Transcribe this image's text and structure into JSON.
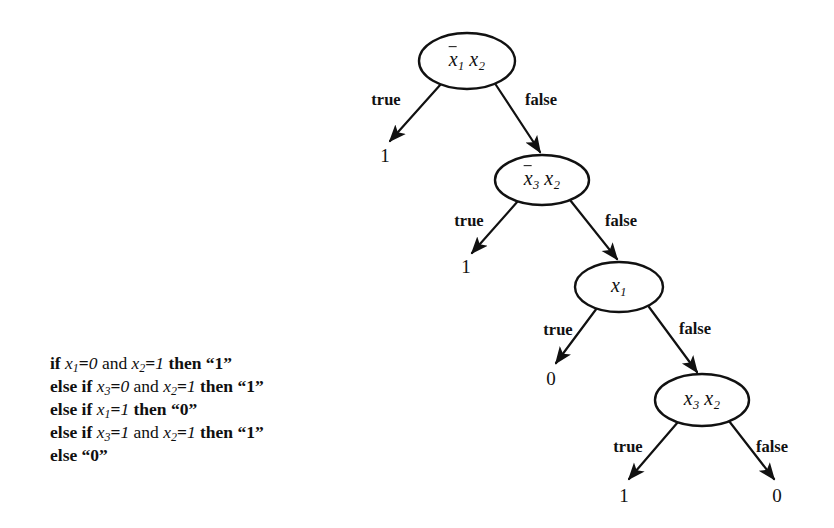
{
  "figure": {
    "type": "decision-tree-diagram",
    "background_color": "#ffffff",
    "ink_color": "#111111"
  },
  "pseudocode": {
    "lines": [
      {
        "id": "line-1",
        "text": "if x1=0 and x2=1 then “1”",
        "parts": [
          {
            "kind": "kw",
            "text": "if"
          },
          {
            "kind": "var",
            "base": "x",
            "sub": "1"
          },
          {
            "kind": "lit",
            "text": "="
          },
          {
            "kind": "num",
            "text": "0"
          },
          {
            "kind": "plain",
            "text": "and"
          },
          {
            "kind": "var",
            "base": "x",
            "sub": "2"
          },
          {
            "kind": "lit",
            "text": "="
          },
          {
            "kind": "num",
            "text": "1"
          },
          {
            "kind": "kw",
            "text": "then"
          },
          {
            "kind": "lit",
            "text": "“1”"
          }
        ]
      },
      {
        "id": "line-2",
        "text": "else if x3=0 and x2=1 then “1”",
        "parts": [
          {
            "kind": "kw",
            "text": "else if"
          },
          {
            "kind": "var",
            "base": "x",
            "sub": "3"
          },
          {
            "kind": "lit",
            "text": "="
          },
          {
            "kind": "num",
            "text": "0"
          },
          {
            "kind": "plain",
            "text": "and"
          },
          {
            "kind": "var",
            "base": "x",
            "sub": "2"
          },
          {
            "kind": "lit",
            "text": "="
          },
          {
            "kind": "num",
            "text": "1"
          },
          {
            "kind": "kw",
            "text": "then"
          },
          {
            "kind": "lit",
            "text": "“1”"
          }
        ]
      },
      {
        "id": "line-3",
        "text": "else if x1=1 then “0”",
        "parts": [
          {
            "kind": "kw",
            "text": "else if"
          },
          {
            "kind": "var",
            "base": "x",
            "sub": "1"
          },
          {
            "kind": "lit",
            "text": "="
          },
          {
            "kind": "num",
            "text": "1"
          },
          {
            "kind": "kw",
            "text": "then"
          },
          {
            "kind": "lit",
            "text": "“0”"
          }
        ]
      },
      {
        "id": "line-4",
        "text": "else if x3=1 and x2=1 then “1”",
        "parts": [
          {
            "kind": "kw",
            "text": "else if"
          },
          {
            "kind": "var",
            "base": "x",
            "sub": "3"
          },
          {
            "kind": "lit",
            "text": "="
          },
          {
            "kind": "num",
            "text": "1"
          },
          {
            "kind": "plain",
            "text": "and"
          },
          {
            "kind": "var",
            "base": "x",
            "sub": "2"
          },
          {
            "kind": "lit",
            "text": "="
          },
          {
            "kind": "num",
            "text": "1"
          },
          {
            "kind": "kw",
            "text": "then"
          },
          {
            "kind": "lit",
            "text": "“1”"
          }
        ]
      },
      {
        "id": "line-5",
        "text": "else “0”",
        "parts": [
          {
            "kind": "kw",
            "text": "else"
          },
          {
            "kind": "lit",
            "text": "“0”"
          }
        ]
      }
    ]
  },
  "tree": {
    "nodes": [
      {
        "id": "node-root",
        "label": "x̄1 x2",
        "base1": "x",
        "sub1": "1",
        "overline1": true,
        "base2": "x",
        "sub2": "2",
        "overline2": false,
        "cx": 467,
        "cy": 61,
        "rx": 48,
        "ry": 28
      },
      {
        "id": "node-2",
        "label": "x̄3 x2",
        "base1": "x",
        "sub1": "3",
        "overline1": true,
        "base2": "x",
        "sub2": "2",
        "overline2": false,
        "cx": 542,
        "cy": 180,
        "rx": 47,
        "ry": 25
      },
      {
        "id": "node-3",
        "label": "x1",
        "base1": "x",
        "sub1": "1",
        "overline1": false,
        "base2": "",
        "sub2": "",
        "overline2": false,
        "cx": 619,
        "cy": 287,
        "rx": 44,
        "ry": 25
      },
      {
        "id": "node-4",
        "label": "x3 x2",
        "base1": "x",
        "sub1": "3",
        "overline1": false,
        "base2": "x",
        "sub2": "2",
        "overline2": false,
        "cx": 702,
        "cy": 400,
        "rx": 47,
        "ry": 26
      }
    ],
    "edges": [
      {
        "id": "edge-root-true",
        "label": "true",
        "lx": 386,
        "ly": 100,
        "x1": 441,
        "y1": 84,
        "x2": 390,
        "y2": 141
      },
      {
        "id": "edge-root-false",
        "label": "false",
        "lx": 541,
        "ly": 100,
        "x1": 496,
        "y1": 85,
        "x2": 540,
        "y2": 152
      },
      {
        "id": "edge-n2-true",
        "label": "true",
        "lx": 469,
        "ly": 221,
        "x1": 518,
        "y1": 201,
        "x2": 472,
        "y2": 253
      },
      {
        "id": "edge-n2-false",
        "label": "false",
        "lx": 621,
        "ly": 221,
        "x1": 570,
        "y1": 200,
        "x2": 617,
        "y2": 259
      },
      {
        "id": "edge-n3-true",
        "label": "true",
        "lx": 558,
        "ly": 330,
        "x1": 597,
        "y1": 308,
        "x2": 556,
        "y2": 363
      },
      {
        "id": "edge-n3-false",
        "label": "false",
        "lx": 695,
        "ly": 329,
        "x1": 649,
        "y1": 307,
        "x2": 697,
        "y2": 372
      },
      {
        "id": "edge-n4-true",
        "label": "true",
        "lx": 628,
        "ly": 447,
        "x1": 678,
        "y1": 422,
        "x2": 629,
        "y2": 479
      },
      {
        "id": "edge-n4-false",
        "label": "false",
        "lx": 772,
        "ly": 447,
        "x1": 729,
        "y1": 421,
        "x2": 774,
        "y2": 479
      }
    ],
    "leaves": [
      {
        "id": "leaf-1",
        "value": "1",
        "x": 385,
        "y": 156
      },
      {
        "id": "leaf-2",
        "value": "1",
        "x": 466,
        "y": 267
      },
      {
        "id": "leaf-3",
        "value": "0",
        "x": 551,
        "y": 379
      },
      {
        "id": "leaf-4",
        "value": "1",
        "x": 624,
        "y": 496
      },
      {
        "id": "leaf-5",
        "value": "0",
        "x": 777,
        "y": 496
      }
    ]
  },
  "chart_data": {
    "type": "diagram",
    "structure": "binary decision tree",
    "decision_nodes": [
      "x̄1x2",
      "x̄3x2",
      "x1",
      "x3x2"
    ],
    "branch_labels": [
      "true",
      "false"
    ],
    "leaf_values": [
      "1",
      "1",
      "0",
      "1",
      "0"
    ],
    "equivalent_rules": [
      "if x1=0 and x2=1 then “1”",
      "else if x3=0 and x2=1 then “1”",
      "else if x1=1 then “0”",
      "else if x3=1 and x2=1 then “1”",
      "else “0”"
    ]
  }
}
